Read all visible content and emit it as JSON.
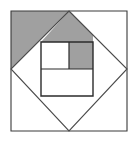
{
  "figure": {
    "canvas": {
      "width": 132,
      "height": 144
    },
    "colors": {
      "background": "#ffffff",
      "shaded": "#a0a0a0",
      "stroke_outer": "#3a3a3a",
      "stroke_diamond": "#4a4a4a",
      "stroke_inner": "#2b2b2b",
      "stroke_divider": "#555555"
    },
    "stroke_widths": {
      "outer_square": 1.1,
      "diamond": 1.1,
      "inner_square": 1.4,
      "divider": 1.1
    },
    "shapes": {
      "outer_square": {
        "name": "outer-square",
        "points": "11,11 127,11 127,131 11,131"
      },
      "diamond": {
        "name": "inscribed-diamond",
        "points": "69,11 127,69 69,131 11,69",
        "vertices": {
          "top": [
            69,
            11
          ],
          "right": [
            127,
            69
          ],
          "bottom": [
            69,
            131
          ],
          "left": [
            11,
            69
          ]
        }
      },
      "inner_square": {
        "name": "inner-square",
        "points": "41,42 93,42 93,96 41,96",
        "left": 41,
        "top": 42,
        "right": 93,
        "bottom": 96
      },
      "inner_vertical_divider": {
        "name": "inner-vertical-divider",
        "x1": 69,
        "y1": 42,
        "x2": 69,
        "y2": 69
      },
      "inner_horizontal_divider": {
        "name": "inner-horizontal-divider",
        "x1": 41,
        "y1": 69,
        "x2": 93,
        "y2": 69
      }
    },
    "shaded_regions": [
      {
        "name": "upper-left-corner-triangle",
        "points": "11,11 69,11 11,69",
        "note": "Triangle between outer square top-left corner and diamond NW edge"
      },
      {
        "name": "upper-wedge-above-inner-square",
        "points": "41,42 69,11 93,35 93,42",
        "note": "Region bounded by diamond NE edge and top of inner square"
      },
      {
        "name": "inner-top-right-cell",
        "points": "69,42 93,42 93,69 69,69",
        "note": "Top-right quadrant cell of the inner square"
      }
    ]
  }
}
